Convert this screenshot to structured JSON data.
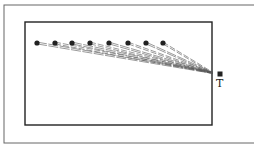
{
  "diagram": {
    "colors": {
      "stroke": "#222222",
      "line": "#555555",
      "outer": "#666666",
      "background": "#ffffff"
    },
    "outer_frame": {
      "x": 4,
      "y": 5,
      "w": 252,
      "h": 138
    },
    "inner_rect": {
      "x": 25,
      "y": 22,
      "w": 187,
      "h": 103
    },
    "sources": [
      {
        "x": 37,
        "y": 43
      },
      {
        "x": 55,
        "y": 43
      },
      {
        "x": 72,
        "y": 43
      },
      {
        "x": 90,
        "y": 43
      },
      {
        "x": 109,
        "y": 43
      },
      {
        "x": 128,
        "y": 43
      },
      {
        "x": 146,
        "y": 43
      },
      {
        "x": 163,
        "y": 43
      }
    ],
    "convergence_point": {
      "x": 213,
      "y": 73
    },
    "target": {
      "x": 220,
      "y": 74,
      "label": "T"
    }
  }
}
